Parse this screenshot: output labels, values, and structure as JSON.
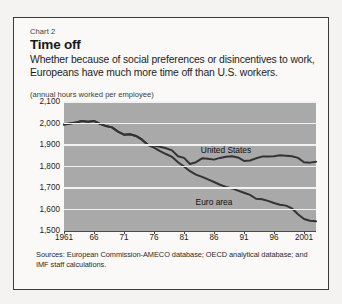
{
  "figure": {
    "kicker": "Chart 2",
    "title": "Time off",
    "subtitle": "Whether because of social preferences or disincentives to work, Europeans have much more time off than U.S. workers.",
    "units_note": "(annual hours worked per employee)",
    "sources": "Sources: European Commission-AMECO database; OECD analytical database; and IMF staff calculations."
  },
  "colors": {
    "plot_background": "#a9a9a9",
    "gridline": "#f2f2f2",
    "line": "#333333",
    "frame_border": "#3a3a3a",
    "page_background": "#f4f3f1"
  },
  "chart_data": {
    "type": "line",
    "title": "Time off",
    "subtitle": "Whether because of social preferences or disincentives to work, Europeans have much more time off than U.S. workers.",
    "xlabel": "",
    "ylabel": "(annual hours worked per employee)",
    "xlim": [
      1961,
      2003
    ],
    "ylim": [
      1500,
      2100
    ],
    "yticks": [
      1500,
      1600,
      1700,
      1800,
      1900,
      2000,
      2100
    ],
    "ytick_labels": [
      "1,500",
      "1,600",
      "1,700",
      "1,800",
      "1,900",
      "2,000",
      "2,100"
    ],
    "xticks": [
      1961,
      1966,
      1971,
      1976,
      1981,
      1986,
      1991,
      1996,
      2001
    ],
    "xtick_labels": [
      "1961",
      "66",
      "71",
      "76",
      "81",
      "86",
      "91",
      "96",
      "2001"
    ],
    "grid": true,
    "legend_position": "inline-annotation",
    "x": [
      1961,
      1962,
      1963,
      1964,
      1965,
      1966,
      1967,
      1968,
      1969,
      1970,
      1971,
      1972,
      1973,
      1974,
      1975,
      1976,
      1977,
      1978,
      1979,
      1980,
      1981,
      1982,
      1983,
      1984,
      1985,
      1986,
      1987,
      1988,
      1989,
      1990,
      1991,
      1992,
      1993,
      1994,
      1995,
      1996,
      1997,
      1998,
      1999,
      2000,
      2001,
      2002,
      2003
    ],
    "series": [
      {
        "name": "United States",
        "label": "United States",
        "values": [
          1995,
          2000,
          2005,
          2012,
          2008,
          2012,
          1998,
          1988,
          1982,
          1962,
          1948,
          1950,
          1942,
          1925,
          1900,
          1898,
          1892,
          1885,
          1875,
          1848,
          1840,
          1812,
          1820,
          1838,
          1836,
          1832,
          1840,
          1845,
          1848,
          1842,
          1826,
          1828,
          1838,
          1846,
          1846,
          1848,
          1852,
          1850,
          1848,
          1840,
          1820,
          1818,
          1822
        ]
      },
      {
        "name": "Euro area",
        "label": "Euro area",
        "values": [
          1995,
          2000,
          2005,
          2012,
          2008,
          2012,
          1998,
          1988,
          1982,
          1962,
          1948,
          1950,
          1942,
          1925,
          1900,
          1888,
          1872,
          1858,
          1845,
          1820,
          1800,
          1778,
          1762,
          1752,
          1740,
          1728,
          1715,
          1705,
          1698,
          1688,
          1678,
          1668,
          1650,
          1648,
          1640,
          1630,
          1622,
          1618,
          1605,
          1578,
          1556,
          1548,
          1545
        ]
      }
    ],
    "annotations": [
      {
        "text": "United States",
        "x": 1988,
        "y": 1870
      },
      {
        "text": "Euro area",
        "x": 1986,
        "y": 1628
      }
    ]
  }
}
